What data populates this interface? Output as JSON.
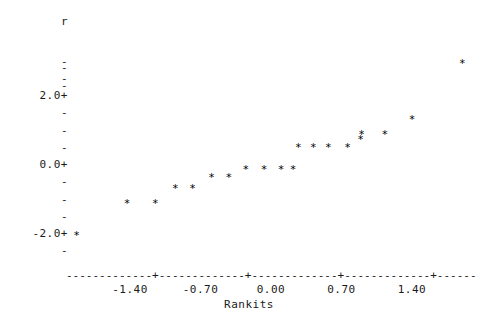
{
  "chart_data": {
    "type": "scatter",
    "title": "",
    "xlabel": "Rankits",
    "ylabel": "r",
    "xlim": [
      -2.05,
      2.05
    ],
    "ylim": [
      -2.7,
      3.2
    ],
    "grid": false,
    "legend": null,
    "marker": "*",
    "x_ticks": [
      {
        "label": "-1.40",
        "value": -1.4
      },
      {
        "label": "-0.70",
        "value": -0.7
      },
      {
        "label": "0.00",
        "value": 0.0
      },
      {
        "label": "0.70",
        "value": 0.7
      },
      {
        "label": "1.40",
        "value": 1.4
      }
    ],
    "y_ticks": [
      {
        "label": "",
        "value": 3.0,
        "glyph": "-"
      },
      {
        "label": "",
        "value": 2.8,
        "glyph": "-"
      },
      {
        "label": "",
        "value": 2.5,
        "glyph": "-"
      },
      {
        "label": "",
        "value": 2.3,
        "glyph": "-"
      },
      {
        "label": "2.0+",
        "value": 2.0,
        "glyph": "+"
      },
      {
        "label": "",
        "value": 1.5,
        "glyph": "-"
      },
      {
        "label": "",
        "value": 1.0,
        "glyph": "-"
      },
      {
        "label": "",
        "value": 0.5,
        "glyph": "-"
      },
      {
        "label": "0.0+",
        "value": 0.0,
        "glyph": "+"
      },
      {
        "label": "",
        "value": -0.5,
        "glyph": "-"
      },
      {
        "label": "",
        "value": -1.0,
        "glyph": "-"
      },
      {
        "label": "",
        "value": -1.5,
        "glyph": "-"
      },
      {
        "label": "-2.0+",
        "value": -2.0,
        "glyph": "+"
      },
      {
        "label": "",
        "value": -2.5,
        "glyph": "-"
      }
    ],
    "points": [
      {
        "x": -1.93,
        "y": -2.03
      },
      {
        "x": -1.43,
        "y": -1.1
      },
      {
        "x": -1.15,
        "y": -1.1
      },
      {
        "x": -0.95,
        "y": -0.67
      },
      {
        "x": -0.78,
        "y": -0.67
      },
      {
        "x": -0.59,
        "y": -0.35
      },
      {
        "x": -0.42,
        "y": -0.35
      },
      {
        "x": -0.25,
        "y": -0.12
      },
      {
        "x": -0.07,
        "y": -0.12
      },
      {
        "x": 0.1,
        "y": -0.12
      },
      {
        "x": 0.22,
        "y": -0.12
      },
      {
        "x": 0.27,
        "y": 0.52
      },
      {
        "x": 0.42,
        "y": 0.52
      },
      {
        "x": 0.57,
        "y": 0.52
      },
      {
        "x": 0.76,
        "y": 0.52
      },
      {
        "x": 0.89,
        "y": 0.75
      },
      {
        "x": 0.9,
        "y": 0.9
      },
      {
        "x": 1.13,
        "y": 0.9
      },
      {
        "x": 1.4,
        "y": 1.33
      },
      {
        "x": 1.9,
        "y": 2.96
      }
    ],
    "colors": {
      "marker": "#000000",
      "axis": "#1a1a1a",
      "background": "#ffffff"
    }
  }
}
